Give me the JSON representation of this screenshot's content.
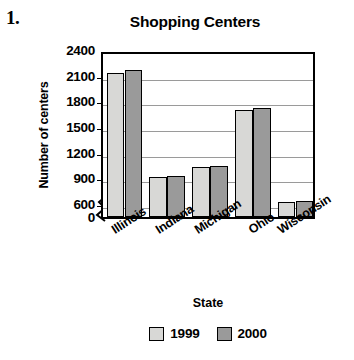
{
  "problem": {
    "number": "1."
  },
  "chart_data": {
    "type": "bar",
    "title": "Shopping Centers",
    "xlabel": "State",
    "ylabel": "Number of centers",
    "categories": [
      "Illinois",
      "Indiana",
      "Michigan",
      "Ohio",
      "Wisconsin"
    ],
    "series": [
      {
        "name": "1999",
        "color": "#d8d8d6",
        "values": [
          2130,
          920,
          1030,
          1700,
          630
        ]
      },
      {
        "name": "2000",
        "color": "#9a9a9a",
        "values": [
          2165,
          925,
          1050,
          1720,
          640
        ]
      }
    ],
    "ylim": [
      0,
      2400
    ],
    "y_ticks": [
      0,
      600,
      900,
      1200,
      1500,
      1800,
      2100,
      2400
    ],
    "y_tick_labels": [
      "0",
      "600",
      "900",
      "1200",
      "1500",
      "1800",
      "2100",
      "2400"
    ],
    "y_axis_break_between": [
      0,
      600
    ],
    "grid": true,
    "legend_position": "bottom",
    "legend_entries": [
      "1999",
      "2000"
    ]
  }
}
